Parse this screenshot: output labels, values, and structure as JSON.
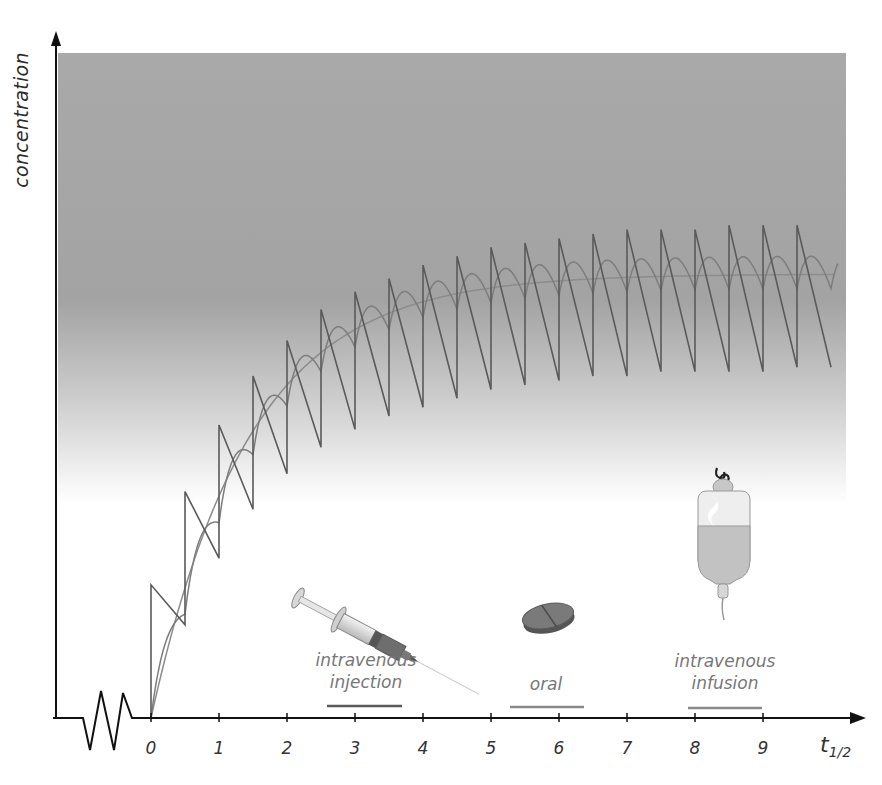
{
  "chart_data": {
    "type": "line",
    "title": "",
    "xlabel": "t1/2",
    "xlabel_main": "t",
    "xlabel_sub": "1/2",
    "ylabel": "concentration",
    "x_ticks": [
      "0",
      "1",
      "2",
      "3",
      "4",
      "5",
      "6",
      "7",
      "8",
      "9"
    ],
    "xlim": [
      0,
      10
    ],
    "ylim": [
      0,
      1.4
    ],
    "grid": false,
    "axis_break": "zigzag on x-axis left of origin",
    "background": "grey gradient band (dark at top, fading to white around concentration ~0.5)",
    "legend_position": "bottom, below curves, with drawn icons",
    "dose_interval_half_lives": 0.5,
    "series": [
      {
        "name": "intravenous injection",
        "style": "sawtooth (instant rise, first-order decay)",
        "color": "#5a5a5a",
        "peaks_x": [
          0,
          0.5,
          1,
          1.5,
          2,
          2.5,
          3,
          3.5,
          4,
          4.5,
          5,
          5.5,
          6,
          6.5,
          7,
          7.5,
          8,
          8.5,
          9,
          9.5
        ],
        "peaks_y": [
          0.3,
          0.51,
          0.66,
          0.77,
          0.85,
          0.92,
          0.96,
          0.99,
          1.02,
          1.04,
          1.06,
          1.07,
          1.08,
          1.09,
          1.1,
          1.1,
          1.1,
          1.11,
          1.11,
          1.11
        ],
        "troughs_y": [
          0.21,
          0.36,
          0.47,
          0.55,
          0.61,
          0.65,
          0.68,
          0.7,
          0.72,
          0.74,
          0.75,
          0.76,
          0.77,
          0.77,
          0.78,
          0.78,
          0.78,
          0.78,
          0.79,
          0.79
        ]
      },
      {
        "name": "oral",
        "style": "rounded oscillation (absorption then elimination)",
        "color": "#8a8a8a",
        "peaks_y_approx": [
          0.2,
          0.4,
          0.55,
          0.68,
          0.78,
          0.85,
          0.9,
          0.94,
          0.97,
          0.99,
          1.01,
          1.02,
          1.03,
          1.03,
          1.04,
          1.04,
          1.04,
          1.04,
          1.04,
          1.04
        ],
        "steady_state_range": [
          0.92,
          1.04
        ]
      },
      {
        "name": "intravenous infusion",
        "style": "smooth exponential approach to plateau",
        "color": "#909090",
        "x": [
          0,
          1,
          2,
          3,
          4,
          5,
          6,
          7,
          8,
          9,
          10
        ],
        "values": [
          0,
          0.5,
          0.75,
          0.875,
          0.94,
          0.97,
          0.984,
          0.992,
          0.996,
          0.998,
          0.999
        ],
        "plateau": 1.0
      }
    ]
  },
  "axis": {
    "ylabel": "concentration",
    "x_unit_main": "t",
    "x_unit_sub": "1/2"
  },
  "legend": [
    {
      "label_lines": [
        "intravenous",
        "injection"
      ],
      "icon": "syringe-icon",
      "line_color": "#5a5a5a"
    },
    {
      "label_lines": [
        "oral"
      ],
      "icon": "pill-icon",
      "line_color": "#8a8a8a"
    },
    {
      "label_lines": [
        "intravenous",
        "infusion"
      ],
      "icon": "iv-bag-icon",
      "line_color": "#909090"
    }
  ],
  "colors": {
    "axis": "#111111",
    "band_top": "#a9a9a9",
    "band_bottom": "#ffffff",
    "label_grey": "#777777"
  }
}
